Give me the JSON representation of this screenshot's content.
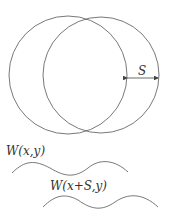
{
  "diagram": {
    "shift_label": "S",
    "wave1_label": "W(x,y)",
    "wave2_label": "W(x+S,y)",
    "stroke_color": "#444444"
  }
}
